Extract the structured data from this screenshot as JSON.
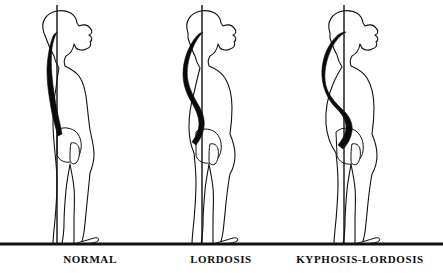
{
  "diagram": {
    "type": "medical-illustration",
    "background_color": "#ffffff",
    "ink_color": "#111111",
    "spine_fill_color": "#0a0a0a",
    "ground_line": {
      "name": "floor-line",
      "y": 244,
      "x_start": 0,
      "x_end": 443,
      "thickness": 3
    },
    "figures": [
      {
        "id": "normal",
        "label": "NORMAL",
        "label_x": 90,
        "label_y": 253,
        "center_x": 70,
        "plumb_line": {
          "x": 57,
          "y_top": 5,
          "y_bottom": 244
        },
        "spine_description": "gentle near-vertical curvature",
        "body_outline": "M 44,33 C 40,22 46,13 57,11 C 69,9 76,15 77,23 L 79,26 C 84,24 88,25 90,28 C 93,31 92,34 89,35 C 92,37 93,40 90,42 C 92,45 90,48 86,49 C 83,51 78,50 76,48 L 74,44 C 73,50 70,54 66,56 C 64,59 64,63 65,66 C 69,68 75,71 79,76 C 84,83 86,93 87,104 C 88,114 89,123 90,130 C 92,139 94,147 94,154 C 94,162 92,168 90,173 C 89,183 88,194 87,203 C 86,213 85,224 84,232 C 83,238 82,242 81,244 L 74,244 C 74,238 74,230 74,222 C 74,210 75,198 74,188 C 73,178 71,170 70,164 C 69,171 67,180 66,190 C 65,201 64,213 64,224 C 64,232 63,238 62,244 L 53,244 C 53,238 54,230 55,220 C 56,208 57,195 57,183 C 57,172 56,162 55,153 C 54,143 53,133 53,123 C 53,110 54,98 56,88 C 57,80 58,73 59,68 C 57,65 55,61 54,56 C 51,51 48,44 46,38 Z",
        "spine_path": "M 57,32 C 55,36 53,41 52,48 C 51,56 51,66 52,76 C 53,88 55,100 57,110 C 59,120 61,128 62,134 L 58,136 C 56,129 53,119 51,108 C 49,96 47,84 47,72 C 47,60 49,48 52,39 C 53,35 55,33 57,32 Z",
        "pelvis": "M 57,130 C 62,127 69,127 75,131 C 80,135 82,142 81,149 C 80,156 76,161 70,162 C 64,163 59,160 57,155 Z",
        "hand": "M 71,143 C 75,142 78,144 79,148 C 80,154 79,160 76,163 C 73,165 70,163 70,159 C 70,153 70,147 71,143 Z",
        "foot": "M 74,244 C 80,242 88,240 94,238 C 98,237 100,239 98,241 C 95,243 88,244 81,244 Z"
      },
      {
        "id": "lordosis",
        "label": "LORDOSIS",
        "label_x": 221,
        "label_y": 253,
        "center_x": 207,
        "plumb_line": {
          "x": 202,
          "y_top": 5,
          "y_bottom": 244
        },
        "spine_description": "exaggerated lumbar inward curve, S-shaped",
        "body_outline": "M 188,33 C 184,22 190,13 201,11 C 213,9 220,15 221,23 L 223,26 C 228,24 232,25 234,28 C 237,31 236,34 233,35 C 236,37 237,40 234,42 C 236,45 234,48 230,49 C 227,51 222,50 220,48 L 218,44 C 217,50 214,54 210,56 C 208,59 208,63 209,66 C 214,68 221,72 225,78 C 230,86 232,97 232,108 C 232,118 231,127 230,134 C 233,141 235,148 235,155 C 235,163 233,169 230,174 C 228,184 227,194 226,203 C 225,213 224,224 223,232 C 222,238 221,242 220,244 L 213,244 C 213,238 213,230 213,222 C 213,210 214,198 213,188 C 212,178 210,170 209,164 C 208,171 206,180 205,190 C 204,201 203,213 203,224 C 203,232 202,238 201,244 L 192,244 C 192,238 193,230 194,220 C 195,208 196,195 196,183 C 196,172 195,162 194,153 C 191,146 189,137 189,127 C 189,115 191,103 194,93 C 196,84 198,75 200,68 C 198,65 196,61 195,56 C 192,51 190,44 188,38 Z",
        "spine_path": "M 203,32 C 199,36 195,42 192,50 C 188,60 186,71 188,81 C 190,91 195,99 199,106 C 203,113 205,120 204,127 C 203,134 200,140 196,145 L 192,142 C 196,136 199,130 199,124 C 199,117 196,110 192,103 C 187,95 183,85 183,74 C 183,62 187,50 193,41 C 196,36 199,33 203,32 Z",
        "pelvis": "M 196,132 C 201,128 209,128 215,132 C 220,136 222,143 221,150 C 220,157 216,162 210,163 C 203,164 198,161 196,156 Z",
        "hand": "M 210,144 C 214,143 217,145 218,149 C 219,155 218,161 215,164 C 212,166 209,164 209,160 C 209,154 209,148 210,144 Z",
        "foot": "M 213,244 C 219,242 227,240 233,238 C 237,237 239,239 237,241 C 234,243 227,244 220,244 Z"
      },
      {
        "id": "kyphosis-lordosis",
        "label": "KYPHOSIS-LORDOSIS",
        "label_x": 360,
        "label_y": 253,
        "center_x": 348,
        "plumb_line": {
          "x": 344,
          "y_top": 5,
          "y_bottom": 244
        },
        "spine_description": "rounded upper-back hump with deep lumbar curve",
        "body_outline": "M 330,33 C 326,22 332,13 343,11 C 355,9 362,15 363,23 L 365,26 C 370,24 374,25 376,28 C 379,31 378,34 375,35 C 378,37 379,40 376,42 C 378,45 376,48 372,49 C 369,51 364,50 362,48 L 360,44 C 359,50 356,54 352,56 C 350,59 350,63 351,66 C 356,68 363,72 367,78 C 372,86 374,97 374,108 C 374,118 373,127 372,134 C 375,141 377,148 377,155 C 377,163 375,169 372,174 C 370,184 369,194 368,203 C 367,213 366,224 365,232 C 364,238 363,242 362,244 L 355,244 C 355,238 355,230 355,222 C 355,210 356,198 355,188 C 354,178 352,170 351,164 C 350,171 348,180 347,190 C 346,201 345,213 345,224 C 345,232 344,238 343,244 L 334,244 C 334,238 335,230 336,220 C 337,208 338,195 338,183 C 338,172 337,162 336,153 C 331,146 327,136 326,124 C 325,110 328,96 333,84 C 337,75 340,70 342,67 C 340,64 338,60 337,55 C 334,50 332,44 330,38 Z",
        "spine_path": "M 346,32 C 340,35 334,42 330,52 C 325,64 323,78 327,89 C 331,99 338,105 344,111 C 350,117 353,124 352,131 C 351,138 348,144 343,149 L 338,145 C 343,139 346,133 346,127 C 346,120 342,114 336,108 C 329,101 323,90 322,77 C 321,62 326,48 334,39 C 338,34 342,32 346,32 Z",
        "pelvis": "M 336,132 C 341,127 350,127 356,131 C 362,136 364,143 363,151 C 362,158 357,163 351,164 C 344,165 339,161 337,156 Z",
        "hand": "M 352,144 C 356,143 359,145 360,149 C 361,155 360,161 357,164 C 354,166 351,164 351,160 C 351,154 351,148 352,144 Z",
        "foot": "M 355,244 C 361,242 369,240 375,238 C 379,237 381,239 379,241 C 376,243 369,244 362,244 Z"
      }
    ]
  }
}
